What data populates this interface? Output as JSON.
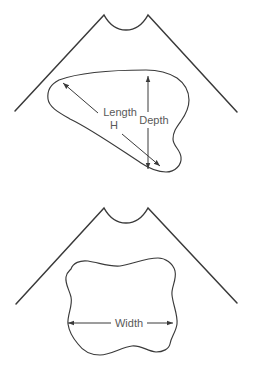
{
  "figure": {
    "background_color": "#ffffff",
    "line_color": "#3a3a3a",
    "label_color": "#595959",
    "upper_diagram": {
      "labels": {
        "length": "Length",
        "h": "H",
        "depth": "Depth"
      }
    },
    "lower_diagram": {
      "labels": {
        "width": "Width"
      }
    }
  }
}
